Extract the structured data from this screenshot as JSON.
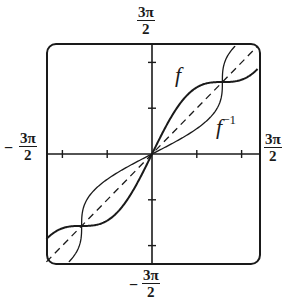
{
  "chart_data": {
    "type": "line",
    "title": "",
    "xlabel": "",
    "ylabel": "",
    "xlim": [
      "-3π/2",
      "3π/2"
    ],
    "ylim": [
      "-3π/2",
      "3π/2"
    ],
    "xlim_numeric": [
      -4.712,
      4.712
    ],
    "ylim_numeric": [
      -4.712,
      4.712
    ],
    "grid": false,
    "legend": "none (inline labels)",
    "axis_labels": {
      "top": {
        "num": "3π",
        "den": "2",
        "sign": ""
      },
      "bottom": {
        "num": "3π",
        "den": "2",
        "sign": "−"
      },
      "left": {
        "num": "3π",
        "den": "2",
        "sign": "−"
      },
      "right": {
        "num": "3π",
        "den": "2",
        "sign": ""
      }
    },
    "ticks": {
      "x": [
        -4,
        -2,
        2,
        4
      ],
      "y": [
        -4,
        -2,
        2,
        4
      ]
    },
    "series": [
      {
        "name": "f",
        "label": "f",
        "style": "solid",
        "expression": "x + sin(x)",
        "points": [
          [
            -4.712,
            -3.712
          ],
          [
            -3.927,
            -3.22
          ],
          [
            -3.1416,
            -3.1416
          ],
          [
            -2.356,
            -3.063
          ],
          [
            -1.571,
            -2.571
          ],
          [
            -0.785,
            -1.492
          ],
          [
            0,
            0
          ],
          [
            0.785,
            1.492
          ],
          [
            1.571,
            2.571
          ],
          [
            2.356,
            3.063
          ],
          [
            3.1416,
            3.1416
          ],
          [
            3.927,
            3.22
          ],
          [
            4.712,
            3.712
          ]
        ]
      },
      {
        "name": "f_inverse",
        "label": "f",
        "label_sup": "−1",
        "style": "solid-thin",
        "expression": "inverse of x + sin(x)",
        "points": [
          [
            -3.712,
            -4.712
          ],
          [
            -3.22,
            -3.927
          ],
          [
            -3.1416,
            -3.1416
          ],
          [
            -3.063,
            -2.356
          ],
          [
            -2.571,
            -1.571
          ],
          [
            -1.492,
            -0.785
          ],
          [
            0,
            0
          ],
          [
            1.492,
            0.785
          ],
          [
            2.571,
            1.571
          ],
          [
            3.063,
            2.356
          ],
          [
            3.1416,
            3.1416
          ],
          [
            3.22,
            3.927
          ],
          [
            3.712,
            4.712
          ]
        ]
      },
      {
        "name": "identity",
        "label": "",
        "style": "dashed",
        "expression": "y = x",
        "points": [
          [
            -4.712,
            -4.712
          ],
          [
            4.712,
            4.712
          ]
        ]
      }
    ],
    "annotations": [
      {
        "text": "f",
        "near": [
          2.0,
          3.3
        ]
      },
      {
        "text": "f^-1",
        "near": [
          3.0,
          1.2
        ]
      }
    ]
  }
}
